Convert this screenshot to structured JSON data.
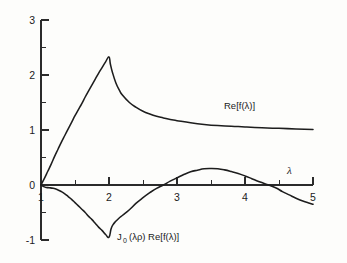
{
  "chart_data": {
    "type": "line",
    "title": "",
    "subtitle": "",
    "xlabel": "λ",
    "ylabel": "",
    "xlim": [
      1,
      5
    ],
    "ylim": [
      -1,
      3
    ],
    "grid": false,
    "legend_position": "inline-annotation",
    "x_ticks_major": [
      1,
      2,
      3,
      4,
      5
    ],
    "x_tick_labels": [
      "1",
      "2",
      "3",
      "4",
      "5"
    ],
    "x_ticks_minor": [
      1.5,
      2.5,
      3.5,
      4.5
    ],
    "y_ticks_major": [
      -1,
      0,
      1,
      2,
      3
    ],
    "y_tick_labels": [
      "-1",
      "0",
      "1",
      "2",
      "3"
    ],
    "y_ticks_minor": [
      -0.5,
      0.5,
      1.5,
      2.5
    ],
    "annotations": [
      {
        "text": "Re[f(λ)]",
        "x": 3.95,
        "y": 1.47
      },
      {
        "text": "J_0 (λρ) Re[f(λ)]",
        "x": 2.45,
        "y": -0.85
      },
      {
        "text": "λ",
        "x": 4.62,
        "y": 0.35
      }
    ],
    "series": [
      {
        "name": "Re[f(λ)]",
        "label": "Re[f(λ)]",
        "color": "#1d1d1d",
        "points": [
          [
            1.0,
            0.0
          ],
          [
            1.05,
            0.12
          ],
          [
            1.1,
            0.25
          ],
          [
            1.15,
            0.38
          ],
          [
            1.2,
            0.52
          ],
          [
            1.25,
            0.65
          ],
          [
            1.3,
            0.78
          ],
          [
            1.35,
            0.9
          ],
          [
            1.4,
            1.02
          ],
          [
            1.45,
            1.14
          ],
          [
            1.5,
            1.26
          ],
          [
            1.55,
            1.37
          ],
          [
            1.6,
            1.48
          ],
          [
            1.65,
            1.6
          ],
          [
            1.7,
            1.71
          ],
          [
            1.75,
            1.82
          ],
          [
            1.8,
            1.93
          ],
          [
            1.85,
            2.04
          ],
          [
            1.9,
            2.14
          ],
          [
            1.95,
            2.24
          ],
          [
            2.0,
            2.33
          ],
          [
            2.02,
            2.2
          ],
          [
            2.05,
            2.05
          ],
          [
            2.1,
            1.86
          ],
          [
            2.15,
            1.73
          ],
          [
            2.2,
            1.63
          ],
          [
            2.3,
            1.5
          ],
          [
            2.4,
            1.41
          ],
          [
            2.5,
            1.34
          ],
          [
            2.6,
            1.29
          ],
          [
            2.7,
            1.25
          ],
          [
            2.8,
            1.22
          ],
          [
            2.9,
            1.19
          ],
          [
            3.0,
            1.17
          ],
          [
            3.2,
            1.13
          ],
          [
            3.4,
            1.1
          ],
          [
            3.6,
            1.08
          ],
          [
            3.8,
            1.07
          ],
          [
            4.0,
            1.055
          ],
          [
            4.25,
            1.04
          ],
          [
            4.5,
            1.03
          ],
          [
            4.75,
            1.02
          ],
          [
            5.0,
            1.01
          ]
        ]
      },
      {
        "name": "J_0 (λρ) Re[f(λ)]",
        "label": "J₀ (λρ) Re[f(λ)]",
        "color": "#1d1d1d",
        "points": [
          [
            1.0,
            0.0
          ],
          [
            1.04,
            -0.03
          ],
          [
            1.08,
            -0.045
          ],
          [
            1.12,
            -0.05
          ],
          [
            1.18,
            -0.06
          ],
          [
            1.25,
            -0.09
          ],
          [
            1.3,
            -0.12
          ],
          [
            1.35,
            -0.16
          ],
          [
            1.4,
            -0.21
          ],
          [
            1.45,
            -0.26
          ],
          [
            1.5,
            -0.32
          ],
          [
            1.55,
            -0.38
          ],
          [
            1.6,
            -0.44
          ],
          [
            1.65,
            -0.5
          ],
          [
            1.7,
            -0.57
          ],
          [
            1.75,
            -0.63
          ],
          [
            1.8,
            -0.7
          ],
          [
            1.85,
            -0.77
          ],
          [
            1.9,
            -0.83
          ],
          [
            1.95,
            -0.9
          ],
          [
            2.0,
            -0.95
          ],
          [
            2.03,
            -0.8
          ],
          [
            2.06,
            -0.72
          ],
          [
            2.1,
            -0.66
          ],
          [
            2.15,
            -0.6
          ],
          [
            2.2,
            -0.55
          ],
          [
            2.3,
            -0.45
          ],
          [
            2.4,
            -0.33
          ],
          [
            2.5,
            -0.23
          ],
          [
            2.6,
            -0.14
          ],
          [
            2.7,
            -0.06
          ],
          [
            2.8,
            0.0
          ],
          [
            2.9,
            0.07
          ],
          [
            3.0,
            0.13
          ],
          [
            3.1,
            0.19
          ],
          [
            3.2,
            0.24
          ],
          [
            3.3,
            0.27
          ],
          [
            3.4,
            0.295
          ],
          [
            3.5,
            0.3
          ],
          [
            3.6,
            0.295
          ],
          [
            3.7,
            0.275
          ],
          [
            3.8,
            0.245
          ],
          [
            3.9,
            0.21
          ],
          [
            4.0,
            0.165
          ],
          [
            4.1,
            0.115
          ],
          [
            4.2,
            0.065
          ],
          [
            4.3,
            0.02
          ],
          [
            4.45,
            -0.05
          ],
          [
            4.55,
            -0.12
          ],
          [
            4.65,
            -0.18
          ],
          [
            4.75,
            -0.24
          ],
          [
            4.85,
            -0.29
          ],
          [
            4.95,
            -0.33
          ],
          [
            5.0,
            -0.35
          ]
        ]
      }
    ]
  },
  "labels": {
    "upper_curve": "Re[f(λ)]",
    "lower_curve_j": "J",
    "lower_curve_sub": "0",
    "lower_curve_rest": "(λρ)  Re[f(λ)]",
    "x_axis_symbol": "λ"
  }
}
